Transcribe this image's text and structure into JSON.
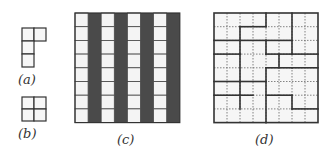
{
  "figure": {
    "panels": [
      {
        "id": "a",
        "label": "(a)",
        "description": "L-tetromino"
      },
      {
        "id": "b",
        "label": "(b)",
        "description": "square tetromino (2x2)"
      },
      {
        "id": "c",
        "label": "(c)",
        "description": "8x8 board with alternating white and dark columns"
      },
      {
        "id": "d",
        "label": "(d)",
        "description": "8x8 board tiled by tetrominoes (bold edges mark pieces)"
      }
    ],
    "board_size": 8,
    "colors": {
      "light": "#f4f4f4",
      "dark": "#4a4a4a",
      "line": "#333333"
    },
    "column_pattern_c": [
      "white",
      "dark",
      "white",
      "dark",
      "white",
      "dark",
      "white",
      "dark"
    ]
  }
}
